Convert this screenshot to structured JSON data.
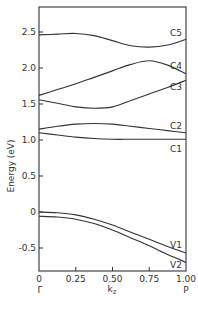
{
  "chart_data": {
    "type": "line",
    "title": "",
    "xlabel": "k_z",
    "ylabel": "Energy (eV)",
    "xlim": [
      0,
      1.0
    ],
    "ylim": [
      -0.75,
      2.85
    ],
    "grid": false,
    "legend": "inline labels at right edge",
    "x_ticks": [
      {
        "value": 0,
        "label": "0"
      },
      {
        "value": 0.25,
        "label": "0.25"
      },
      {
        "value": 0.5,
        "label": "0.50"
      },
      {
        "value": 0.75,
        "label": "0.75"
      },
      {
        "value": 1.0,
        "label": "1.00"
      }
    ],
    "y_ticks": [
      {
        "value": 2.5,
        "label": "2.5"
      },
      {
        "value": 2.0,
        "label": "2.0"
      },
      {
        "value": 1.5,
        "label": "1.5"
      },
      {
        "value": 1.0,
        "label": "1.0"
      },
      {
        "value": 0.5,
        "label": "0.5"
      },
      {
        "value": 0,
        "label": "0"
      },
      {
        "value": -0.5,
        "label": "-0.5"
      }
    ],
    "x_point_labels": [
      {
        "value": 0,
        "label": "Γ"
      },
      {
        "value": 1.0,
        "label": "P"
      }
    ],
    "x": [
      0,
      0.125,
      0.25,
      0.375,
      0.5,
      0.625,
      0.75,
      0.875,
      1.0
    ],
    "series": [
      {
        "name": "C5",
        "values": [
          2.46,
          2.47,
          2.48,
          2.45,
          2.38,
          2.31,
          2.29,
          2.32,
          2.4
        ]
      },
      {
        "name": "C4",
        "values": [
          1.62,
          1.7,
          1.78,
          1.87,
          1.96,
          2.05,
          2.1,
          2.04,
          1.92
        ]
      },
      {
        "name": "C3",
        "values": [
          1.56,
          1.51,
          1.46,
          1.44,
          1.46,
          1.55,
          1.64,
          1.73,
          1.83
        ]
      },
      {
        "name": "C2",
        "values": [
          1.15,
          1.19,
          1.22,
          1.23,
          1.22,
          1.19,
          1.16,
          1.13,
          1.1
        ]
      },
      {
        "name": "C1",
        "values": [
          1.1,
          1.07,
          1.04,
          1.02,
          1.01,
          1.01,
          1.01,
          1.01,
          1.01
        ]
      },
      {
        "name": "V1",
        "values": [
          0.0,
          -0.01,
          -0.04,
          -0.1,
          -0.18,
          -0.28,
          -0.38,
          -0.48,
          -0.57
        ]
      },
      {
        "name": "V2",
        "values": [
          -0.06,
          -0.07,
          -0.1,
          -0.16,
          -0.25,
          -0.36,
          -0.47,
          -0.59,
          -0.7
        ]
      }
    ]
  },
  "labels": {
    "ylabel": "Energy (eV)",
    "xlabel": "k",
    "xlabel_sub": "z",
    "gamma": "Γ",
    "p": "P"
  }
}
